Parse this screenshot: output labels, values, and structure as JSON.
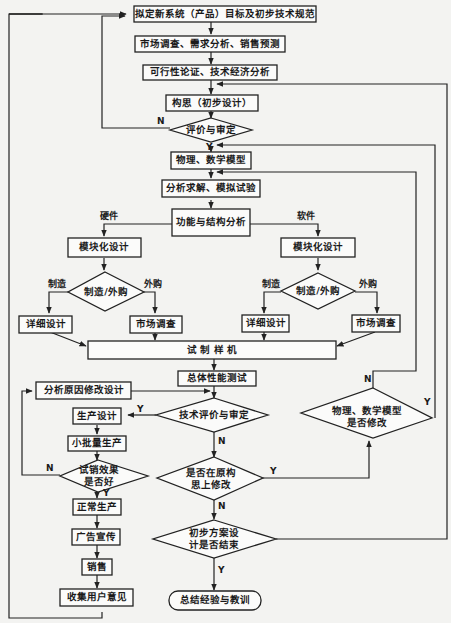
{
  "diagram": {
    "type": "flowchart",
    "nodes": {
      "n1": "拟定新系统（产品）目标及初步技术规范",
      "n2": "市场调查、需求分析、销售预测",
      "n3": "可行性论证、技术经济分析",
      "n4": "构思（初步设计）",
      "d1": "评价与审定",
      "n5": "物理、数学模型",
      "n6": "分析求解、模拟试验",
      "n7": "功能与结构分析",
      "hw_mod": "模块化设计",
      "sw_mod": "模块化设计",
      "hw_dec": "制造/外购",
      "sw_dec": "制造/外购",
      "hw_detail": "详细设计",
      "hw_market": "市场调查",
      "sw_detail": "详细设计",
      "sw_market": "市场调查",
      "proto": "试 制 样 机",
      "perf": "总体性能测试",
      "fix": "分析原因修改设计",
      "d_tech": "技术评价与审定",
      "prod_design": "生产设计",
      "small_batch": "小批量生产",
      "d_trial_1": "试销效果",
      "d_trial_2": "是否好",
      "normal_prod": "正常生产",
      "ads": "广告宣传",
      "sales": "销售",
      "feedback": "收集用户意见",
      "d_orig_1": "是否在原构",
      "d_orig_2": "思上修改",
      "d_model_1": "物理、数学模型",
      "d_model_2": "是否修改",
      "d_end_1": "初步方案设",
      "d_end_2": "计是否结束",
      "summary": "总结经验与教训"
    },
    "edge_labels": {
      "hardware": "硬件",
      "software": "软件",
      "make": "制造",
      "buy": "外购",
      "yes": "Y",
      "no": "N"
    }
  }
}
